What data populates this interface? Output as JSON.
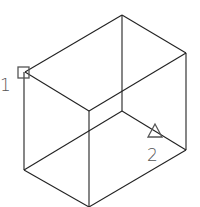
{
  "diagram": {
    "type": "isometric-box-wireframe",
    "points": [
      {
        "id": "point-1",
        "label": "1",
        "marker": "square",
        "x": 24,
        "y": 72
      },
      {
        "id": "point-2",
        "label": "2",
        "marker": "triangle",
        "x": 155,
        "y": 133
      }
    ],
    "colors": {
      "edges": "#222222",
      "markers": "#555555",
      "background": "#ffffff"
    }
  }
}
